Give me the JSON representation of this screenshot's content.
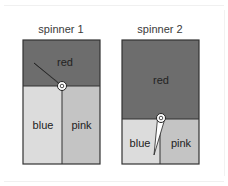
{
  "spinners": [
    {
      "title": "spinner 1",
      "regions": [
        {
          "name": "red",
          "label": "red",
          "color": "#6d6d6d"
        },
        {
          "name": "blue",
          "label": "blue",
          "color": "#dcdcdc"
        },
        {
          "name": "pink",
          "label": "pink",
          "color": "#c4c4c4"
        }
      ]
    },
    {
      "title": "spinner 2",
      "regions": [
        {
          "name": "red",
          "label": "red",
          "color": "#6d6d6d"
        },
        {
          "name": "blue",
          "label": "blue",
          "color": "#dcdcdc"
        },
        {
          "name": "pink",
          "label": "pink",
          "color": "#c4c4c4"
        }
      ]
    }
  ]
}
